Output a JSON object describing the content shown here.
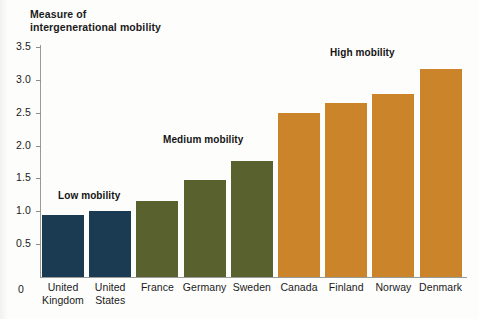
{
  "chart_data": {
    "type": "bar",
    "title": "",
    "ylabel": "Measure of intergenerational mobility",
    "ylabel_lines": [
      "Measure of",
      "intergenerational mobility"
    ],
    "xlabel": "",
    "ylim": [
      0,
      3.5
    ],
    "grid": false,
    "legend": "none",
    "tick_labels": [
      "3.5",
      "3.0",
      "2.5",
      "2.0",
      "1.5",
      "1.0",
      "0.5",
      "0"
    ],
    "tick_values": [
      3.5,
      3.0,
      2.5,
      2.0,
      1.5,
      1.0,
      0.5,
      0
    ],
    "categories": [
      "United Kingdom",
      "United States",
      "France",
      "Germany",
      "Sweden",
      "Canada",
      "Finland",
      "Norway",
      "Denmark"
    ],
    "category_lines": [
      [
        "United",
        "Kingdom"
      ],
      [
        "United",
        "States"
      ],
      [
        "France"
      ],
      [
        "Germany"
      ],
      [
        "Sweden"
      ],
      [
        "Canada"
      ],
      [
        "Finland"
      ],
      [
        "Norway"
      ],
      [
        "Denmark"
      ]
    ],
    "values": [
      0.94,
      1.0,
      1.16,
      1.48,
      1.76,
      2.5,
      2.65,
      2.79,
      3.17
    ],
    "groups": [
      "low",
      "low",
      "medium",
      "medium",
      "medium",
      "high",
      "high",
      "high",
      "high"
    ],
    "annotations": [
      {
        "text": "Low mobility",
        "group": "low"
      },
      {
        "text": "Medium mobility",
        "group": "medium"
      },
      {
        "text": "High mobility",
        "group": "high"
      }
    ],
    "colors": {
      "low": "#1b3b53",
      "medium": "#59612f",
      "high": "#cb8429",
      "axis": "#9a9a96",
      "text": "#1b1b1b",
      "background": "#fdfdfc"
    }
  },
  "annotations": {
    "low": "Low mobility",
    "medium": "Medium mobility",
    "high": "High mobility"
  },
  "zero_label": "0"
}
